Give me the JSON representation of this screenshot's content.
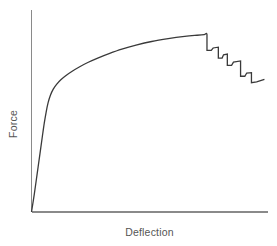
{
  "chart_data": {
    "type": "line",
    "title": "",
    "subtitle": "",
    "xlabel": "Deflection",
    "ylabel": "Force",
    "grid": false,
    "legend": false,
    "legend_position": "none",
    "axis_ticks": false,
    "tick_labels": {
      "x": [],
      "y": []
    },
    "xlim": [
      0,
      1
    ],
    "ylim": [
      0,
      1
    ],
    "series": [
      {
        "name": "Force vs Deflection",
        "color": "#3a3a3a",
        "points": [
          [
            0.0,
            0.0
          ],
          [
            0.012,
            0.09
          ],
          [
            0.024,
            0.19
          ],
          [
            0.036,
            0.29
          ],
          [
            0.046,
            0.375
          ],
          [
            0.054,
            0.44
          ],
          [
            0.062,
            0.495
          ],
          [
            0.07,
            0.54
          ],
          [
            0.08,
            0.578
          ],
          [
            0.092,
            0.608
          ],
          [
            0.106,
            0.632
          ],
          [
            0.124,
            0.655
          ],
          [
            0.146,
            0.676
          ],
          [
            0.172,
            0.697
          ],
          [
            0.202,
            0.718
          ],
          [
            0.238,
            0.74
          ],
          [
            0.28,
            0.762
          ],
          [
            0.328,
            0.784
          ],
          [
            0.382,
            0.806
          ],
          [
            0.442,
            0.826
          ],
          [
            0.508,
            0.844
          ],
          [
            0.578,
            0.858
          ],
          [
            0.648,
            0.869
          ],
          [
            0.7,
            0.875
          ],
          [
            0.73,
            0.878
          ],
          [
            0.742,
            0.878
          ],
          [
            0.742,
            0.8
          ],
          [
            0.76,
            0.8
          ],
          [
            0.768,
            0.812
          ],
          [
            0.79,
            0.816
          ],
          [
            0.79,
            0.762
          ],
          [
            0.806,
            0.762
          ],
          [
            0.812,
            0.778
          ],
          [
            0.828,
            0.782
          ],
          [
            0.828,
            0.726
          ],
          [
            0.846,
            0.726
          ],
          [
            0.854,
            0.742
          ],
          [
            0.884,
            0.748
          ],
          [
            0.884,
            0.672
          ],
          [
            0.902,
            0.672
          ],
          [
            0.91,
            0.688
          ],
          [
            0.93,
            0.69
          ],
          [
            0.93,
            0.64
          ],
          [
            0.952,
            0.644
          ],
          [
            0.985,
            0.656
          ]
        ]
      }
    ]
  },
  "axes": {
    "y_axis_name": "y-axis",
    "x_axis_name": "x-axis",
    "color": "#8a8a8a"
  },
  "colors": {
    "background": "#ffffff",
    "curve": "#3a3a3a",
    "axis": "#8a8a8a",
    "label_text": "#555555"
  }
}
